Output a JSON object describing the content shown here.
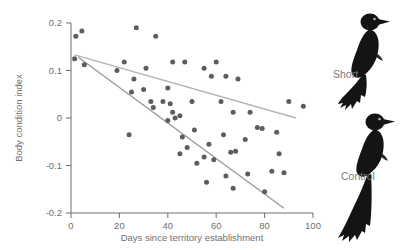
{
  "figure": {
    "background": "#ffffff",
    "dot_color": "#5d5d5d",
    "line_color_short": "#b4b4b4",
    "line_color_control": "#9a9a9a",
    "axis_color": "#6f6f6f",
    "bird_color": "#1a1a1a"
  },
  "legend": {
    "short_label": "Short",
    "control_label": "Control",
    "short_icon": "bird-short-tail-icon",
    "control_icon": "bird-long-tail-icon"
  },
  "chart_data": {
    "type": "scatter",
    "title": "",
    "xlabel": "Days since territory establishment",
    "ylabel": "Body condition index",
    "xlim": [
      0,
      100
    ],
    "ylim": [
      -0.2,
      0.2
    ],
    "xticks": [
      0,
      20,
      40,
      60,
      80,
      100
    ],
    "yticks": [
      0.2,
      0.1,
      0,
      -0.1,
      -0.2
    ],
    "xtick_labels": [
      "0",
      "20",
      "40",
      "60",
      "80",
      "100"
    ],
    "ytick_labels": [
      "0.2",
      "0.1",
      "0",
      "-0.1",
      "-0.2"
    ],
    "grid": false,
    "legend_position": "right",
    "series": [
      {
        "name": "Short",
        "points": [
          [
            2,
            0.172
          ],
          [
            4.5,
            0.183
          ],
          [
            1.5,
            0.125
          ],
          [
            5.5,
            0.112
          ],
          [
            27,
            0.19
          ],
          [
            35,
            0.172
          ],
          [
            22,
            0.118
          ],
          [
            31,
            0.105
          ],
          [
            42,
            0.118
          ],
          [
            47,
            0.118
          ],
          [
            55,
            0.105
          ],
          [
            60,
            0.118
          ],
          [
            58,
            0.088
          ],
          [
            64,
            0.088
          ],
          [
            69,
            0.082
          ],
          [
            40,
            0.063
          ],
          [
            50,
            0.035
          ],
          [
            62,
            0.035
          ],
          [
            67,
            0.012
          ],
          [
            74,
            0.012
          ],
          [
            30,
            0.06
          ],
          [
            34,
            0.022
          ],
          [
            24,
            -0.035
          ],
          [
            90,
            0.035
          ],
          [
            96,
            0.025
          ]
        ]
      },
      {
        "name": "Control",
        "points": [
          [
            19,
            0.1
          ],
          [
            26,
            0.082
          ],
          [
            25,
            0.055
          ],
          [
            33,
            0.035
          ],
          [
            38,
            0.035
          ],
          [
            41,
            0.03
          ],
          [
            42,
            0.012
          ],
          [
            43,
            0.0
          ],
          [
            45,
            0.005
          ],
          [
            40,
            -0.005
          ],
          [
            46,
            -0.04
          ],
          [
            45,
            -0.075
          ],
          [
            48,
            -0.062
          ],
          [
            52,
            -0.095
          ],
          [
            55,
            -0.082
          ],
          [
            57,
            -0.055
          ],
          [
            59,
            -0.088
          ],
          [
            51,
            -0.025
          ],
          [
            63,
            -0.035
          ],
          [
            66,
            -0.072
          ],
          [
            68,
            -0.07
          ],
          [
            72,
            -0.045
          ],
          [
            77,
            -0.02
          ],
          [
            79,
            -0.022
          ],
          [
            85,
            -0.03
          ],
          [
            86,
            -0.075
          ],
          [
            88,
            -0.115
          ],
          [
            83,
            -0.112
          ],
          [
            73,
            -0.118
          ],
          [
            67,
            -0.148
          ],
          [
            80,
            -0.155
          ],
          [
            64,
            -0.122
          ],
          [
            56,
            -0.135
          ]
        ]
      }
    ],
    "regression_lines": [
      {
        "name": "Short",
        "x_start": 1.5,
        "y_start": 0.133,
        "x_end": 93,
        "y_end": 0.0,
        "color": "#b4b4b4"
      },
      {
        "name": "Control",
        "x_start": 3,
        "y_start": 0.128,
        "x_end": 88,
        "y_end": -0.19,
        "color": "#9a9a9a"
      }
    ]
  }
}
